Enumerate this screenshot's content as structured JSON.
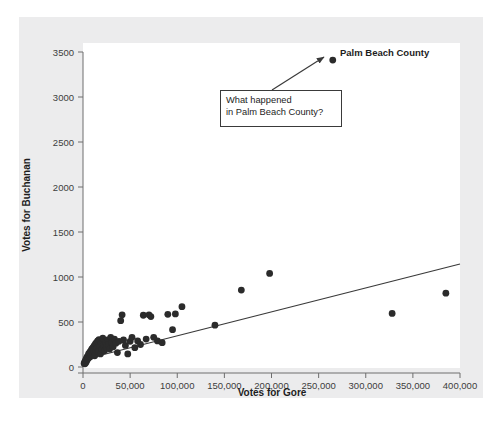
{
  "chart_data": {
    "type": "scatter",
    "title": "",
    "xlabel": "Votes for Gore",
    "ylabel": "Votes for Buchanan",
    "xlim": [
      0,
      400000
    ],
    "ylim": [
      0,
      3500
    ],
    "grid": false,
    "legend": "none",
    "xticks": [
      {
        "value": 0,
        "label": "0"
      },
      {
        "value": 50000,
        "label": "50,000"
      },
      {
        "value": 100000,
        "label": "100,000"
      },
      {
        "value": 150000,
        "label": "150,000"
      },
      {
        "value": 200000,
        "label": "200,000"
      },
      {
        "value": 250000,
        "label": "250,000"
      },
      {
        "value": 300000,
        "label": "300,000"
      },
      {
        "value": 350000,
        "label": "350,000"
      },
      {
        "value": 400000,
        "label": "400,000"
      }
    ],
    "yticks": [
      {
        "value": 0,
        "label": "0"
      },
      {
        "value": 500,
        "label": "500"
      },
      {
        "value": 1000,
        "label": "1000"
      },
      {
        "value": 1500,
        "label": "1500"
      },
      {
        "value": 2000,
        "label": "2000"
      },
      {
        "value": 2500,
        "label": "2500"
      },
      {
        "value": 3000,
        "label": "3000"
      },
      {
        "value": 3500,
        "label": "3500"
      }
    ],
    "series": [
      {
        "name": "Florida counties",
        "marker": "filled-circle",
        "color": "#2b2b2b",
        "points": [
          [
            1200,
            40
          ],
          [
            1800,
            55
          ],
          [
            2100,
            35
          ],
          [
            2400,
            60
          ],
          [
            2800,
            75
          ],
          [
            3100,
            50
          ],
          [
            3400,
            90
          ],
          [
            3900,
            70
          ],
          [
            4200,
            110
          ],
          [
            4600,
            85
          ],
          [
            5100,
            120
          ],
          [
            5500,
            95
          ],
          [
            5900,
            145
          ],
          [
            6300,
            105
          ],
          [
            6800,
            130
          ],
          [
            7200,
            165
          ],
          [
            7700,
            115
          ],
          [
            8100,
            150
          ],
          [
            8600,
            185
          ],
          [
            9000,
            135
          ],
          [
            9500,
            200
          ],
          [
            10000,
            160
          ],
          [
            10600,
            215
          ],
          [
            11200,
            175
          ],
          [
            11800,
            235
          ],
          [
            12400,
            125
          ],
          [
            13000,
            255
          ],
          [
            13600,
            190
          ],
          [
            14200,
            270
          ],
          [
            14900,
            210
          ],
          [
            15600,
            290
          ],
          [
            16300,
            170
          ],
          [
            17000,
            305
          ],
          [
            17800,
            230
          ],
          [
            18500,
            145
          ],
          [
            19300,
            265
          ],
          [
            20100,
            195
          ],
          [
            21000,
            320
          ],
          [
            21900,
            240
          ],
          [
            22800,
            180
          ],
          [
            23800,
            280
          ],
          [
            24800,
            215
          ],
          [
            25900,
            300
          ],
          [
            27000,
            250
          ],
          [
            28200,
            200
          ],
          [
            29400,
            330
          ],
          [
            30700,
            270
          ],
          [
            32000,
            225
          ],
          [
            33400,
            310
          ],
          [
            34900,
            265
          ],
          [
            36500,
            160
          ],
          [
            38200,
            285
          ],
          [
            40000,
            515
          ],
          [
            41500,
            580
          ],
          [
            43000,
            300
          ],
          [
            45000,
            240
          ],
          [
            47500,
            145
          ],
          [
            50000,
            285
          ],
          [
            52000,
            330
          ],
          [
            55000,
            215
          ],
          [
            58000,
            290
          ],
          [
            61000,
            250
          ],
          [
            64000,
            575
          ],
          [
            67000,
            310
          ],
          [
            70000,
            580
          ],
          [
            72000,
            560
          ],
          [
            75000,
            330
          ],
          [
            79000,
            290
          ],
          [
            84000,
            270
          ],
          [
            90000,
            585
          ],
          [
            95000,
            415
          ],
          [
            98000,
            590
          ],
          [
            105000,
            670
          ],
          [
            140000,
            465
          ],
          [
            168000,
            855
          ],
          [
            198000,
            1040
          ],
          [
            328000,
            595
          ],
          [
            385000,
            820
          ]
        ]
      },
      {
        "name": "Palm Beach County",
        "marker": "filled-circle",
        "color": "#2b2b2b",
        "points": [
          [
            265000,
            3410
          ]
        ]
      }
    ],
    "trendline": {
      "name": "regression-line",
      "color": "#3a3a3a",
      "x0": 0,
      "y0": 80,
      "x1": 400000,
      "y1": 1145
    },
    "annotations": [
      {
        "name": "palm-beach-county-label",
        "text": "Palm Beach County",
        "bold": true,
        "x": 265000,
        "y": 3410
      },
      {
        "name": "callout",
        "text": "What happened\nin Palm Beach County?",
        "boxed": true,
        "arrow_to_x": 265000,
        "arrow_to_y": 3410
      }
    ]
  },
  "axis": {
    "x_title": "Votes for Gore",
    "y_title": "Votes for Buchanan"
  },
  "callout": {
    "line1": "What happened",
    "line2": "in Palm Beach County?",
    "text": "What happened\nin Palm Beach County?"
  },
  "labels": {
    "palm_beach": "Palm Beach County"
  },
  "colors": {
    "figure_background": "#ececed",
    "plot_background": "#ffffff",
    "marker": "#2b2b2b",
    "line": "#3a3a3a",
    "axis": "#6e6e6e",
    "text": "#1d1d1d"
  }
}
